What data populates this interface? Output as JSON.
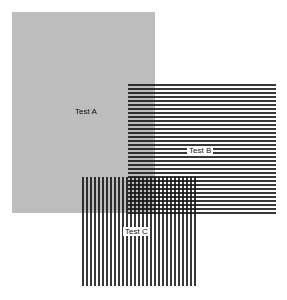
{
  "diagram": {
    "panels": [
      {
        "id": "A",
        "label": "Test A",
        "fill": "solid gray",
        "color": "#bdbdbd"
      },
      {
        "id": "B",
        "label": "Test B",
        "fill": "horizontal lines",
        "color": "#141414"
      },
      {
        "id": "C",
        "label": "Test C",
        "fill": "vertical lines",
        "color": "#141414"
      }
    ]
  }
}
